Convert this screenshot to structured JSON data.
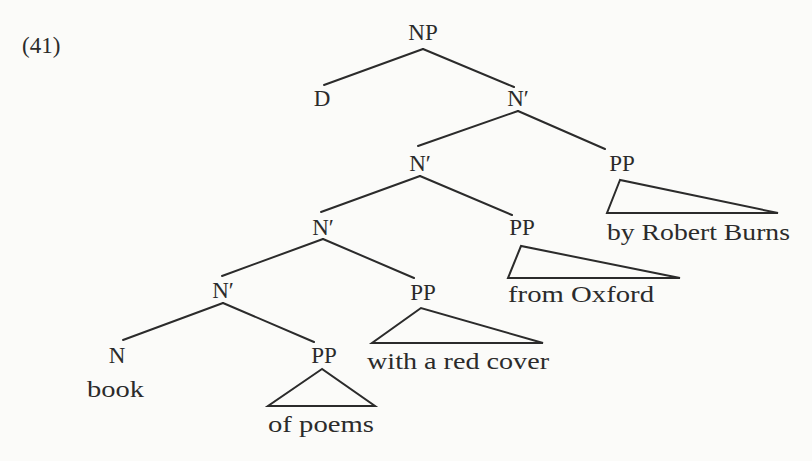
{
  "example_number": "(41)",
  "tree": {
    "root": "NP",
    "nodes": {
      "np": "NP",
      "d": "D",
      "nbar1": "N′",
      "nbar2": "N′",
      "pp_burns": "PP",
      "nbar3": "N′",
      "pp_oxford": "PP",
      "nbar4": "N′",
      "pp_cover": "PP",
      "n": "N",
      "pp_poems": "PP"
    },
    "leaves": {
      "book": "book",
      "of_poems": "of poems",
      "with_a_red_cover": "with a red cover",
      "from_oxford": "from Oxford",
      "by_robert_burns": "by Robert Burns"
    },
    "bracketing": "[NP D [N′ [N′ [N′ [N′ [N book] [PP of poems]] [PP with a red cover]] [PP from Oxford]] [PP by Robert Burns]]]"
  },
  "colors": {
    "ink": "#2b2b2b",
    "paper": "#fbfbf9"
  }
}
